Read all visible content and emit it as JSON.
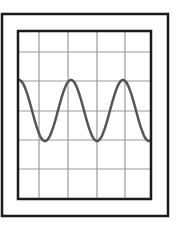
{
  "diagram": {
    "outer_frame": {
      "x": 2,
      "y": 14,
      "w": 166,
      "h": 202,
      "stroke": "#1a1a1a",
      "width": 2.5
    },
    "screen": {
      "x": 18,
      "y": 31,
      "w": 133,
      "h": 168,
      "stroke": "#1a1a1a",
      "width": 2.5
    },
    "grid": {
      "color": "#9a9a9a",
      "vertical_x": [
        39,
        68,
        97,
        125
      ],
      "horizontal_y": [
        52,
        81,
        111,
        140,
        169
      ]
    },
    "waveform": {
      "type": "sine",
      "color": "#555555",
      "stroke_width": 2.5,
      "x_start": 19,
      "x_end": 150,
      "peak_y": 80,
      "trough_y": 141,
      "period_px": 52,
      "phase": "starts-at-peak",
      "cycles_visible": 2.5
    }
  }
}
